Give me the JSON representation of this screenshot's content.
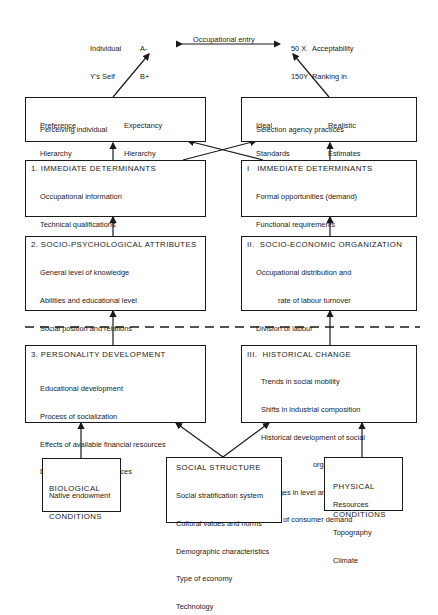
{
  "outcomes": {
    "individual": {
      "labels": [
        "Individual",
        "Y's Self",
        "Presentation",
        "Order"
      ],
      "grades": [
        "A-",
        "B+",
        "C0"
      ]
    },
    "organization": {
      "scores": [
        "50 X",
        "150Y",
        "0  Z"
      ],
      "labels": [
        "Acceptability",
        "Ranking in",
        "Occupation B"
      ]
    },
    "entry_label": "Occupational entry"
  },
  "perception": {
    "left": {
      "col1": [
        "Preference",
        "Hierarchy"
      ],
      "col2": [
        "Expectancy",
        "Hierarchy"
      ],
      "footer": "Perceiving individual"
    },
    "right": {
      "col1": [
        "Ideal",
        "Standards"
      ],
      "col2": [
        "Realistic",
        "Estimates"
      ],
      "footer": "Selection agency practices"
    }
  },
  "individual_side": [
    {
      "title": "1. IMMEDIATE DETERMINANTS",
      "items": [
        "Occupational information",
        "Technical qualifications",
        "Social role characteristics",
        "Reward value hierarchy"
      ]
    },
    {
      "title": "2. SOCIO-PSYCHOLOGICAL ATTRIBUTES",
      "items": [
        "General level of knowledge",
        "Abilities and educational level",
        "Social position and relations",
        "Orientation to occupational life"
      ],
      "sub": [
        "(its importance, identification",
        "with models, aspirations, etc.)"
      ]
    },
    {
      "title": "3. PERSONALITY DEVELOPMENT",
      "items": [
        "Educational development",
        "Process of socialization",
        "Effects of available financial resources",
        "Differential family influences"
      ]
    }
  ],
  "organization_side": [
    {
      "title": "I   IMMEDIATE DETERMINANTS",
      "items": [
        "Formal opportunities (demand)",
        "Functional requirements",
        "Non-functional requirements",
        "Amount and types of rewards"
      ]
    },
    {
      "title": "II.  SOCIO-ECONOMIC ORGANIZATION",
      "lines": [
        "Occupational distribution and",
        "rate of labour turnover",
        "Division of labour",
        "Policies of relevant organizations",
        "(Government, firms, unions, etc.)",
        "Stage of the business cycle"
      ]
    },
    {
      "title": "III.  HISTORICAL CHANGE",
      "lines": [
        "Trends in social mobility",
        "Shifts in industrial composition",
        "Historical development of social",
        "organizations",
        "Changes in level and structure",
        "of consumer demand"
      ]
    }
  ],
  "base_conditions": {
    "biological": {
      "title": [
        "BIOLOGICAL",
        "CONDITIONS"
      ],
      "items": [
        "Native endowment"
      ]
    },
    "social": {
      "title": "SOCIAL STRUCTURE",
      "items": [
        "Social stratification system",
        "Cultural values and norms",
        "Demographic characteristics",
        "Type of economy",
        "Technology"
      ]
    },
    "physical": {
      "title": [
        "PHYSICAL",
        "CONDITIONS"
      ],
      "items": [
        "Resources",
        "Topography",
        "Climate"
      ]
    }
  }
}
